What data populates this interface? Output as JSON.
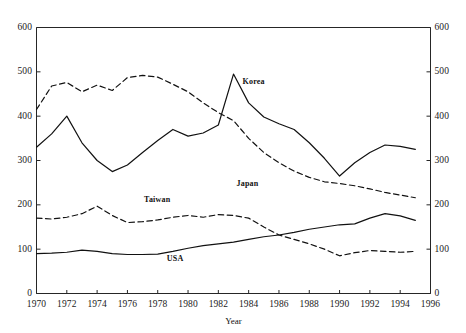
{
  "chart_data": {
    "type": "line",
    "title": "",
    "xlabel": "Year",
    "ylabel": "",
    "xlim": [
      1970,
      1996
    ],
    "ylim": [
      0,
      600
    ],
    "grid": false,
    "legend_position": "inline-annotations",
    "x_ticks": [
      "1970",
      "1972",
      "1974",
      "1976",
      "1978",
      "1980",
      "1982",
      "1984",
      "1986",
      "1988",
      "1990",
      "1992",
      "1994",
      "1996"
    ],
    "y_ticks_left": [
      "0",
      "100",
      "200",
      "300",
      "400",
      "500",
      "600"
    ],
    "y_ticks_right": [
      "0",
      "100",
      "200",
      "300",
      "400",
      "500",
      "600"
    ],
    "x": [
      1970,
      1971,
      1972,
      1973,
      1974,
      1975,
      1976,
      1977,
      1978,
      1979,
      1980,
      1981,
      1982,
      1983,
      1984,
      1985,
      1986,
      1987,
      1988,
      1989,
      1990,
      1991,
      1992,
      1993,
      1994,
      1995
    ],
    "series": [
      {
        "name": "Japan",
        "style": "dashed",
        "color": "#111111",
        "label_x": 1983.2,
        "label_y": 248,
        "values": [
          415,
          468,
          476,
          455,
          470,
          458,
          487,
          492,
          488,
          472,
          455,
          430,
          408,
          390,
          350,
          318,
          295,
          276,
          262,
          252,
          248,
          243,
          236,
          228,
          222,
          216
        ]
      },
      {
        "name": "Korea",
        "style": "solid",
        "color": "#111111",
        "label_x": 1983.6,
        "label_y": 478,
        "values": [
          330,
          360,
          400,
          340,
          300,
          275,
          290,
          318,
          345,
          370,
          355,
          362,
          380,
          495,
          430,
          398,
          383,
          370,
          340,
          305,
          265,
          295,
          318,
          335,
          332,
          325
        ]
      },
      {
        "name": "Taiwan",
        "style": "dashed",
        "color": "#111111",
        "label_x": 1977.1,
        "label_y": 212,
        "values": [
          170,
          168,
          172,
          180,
          197,
          176,
          160,
          162,
          166,
          172,
          176,
          172,
          178,
          176,
          170,
          150,
          132,
          122,
          112,
          100,
          85,
          92,
          97,
          95,
          93,
          95
        ]
      },
      {
        "name": "USA",
        "style": "solid",
        "color": "#111111",
        "label_x": 1978.6,
        "label_y": 78,
        "values": [
          90,
          91,
          93,
          98,
          95,
          90,
          88,
          88,
          89,
          95,
          102,
          108,
          112,
          116,
          122,
          128,
          132,
          138,
          145,
          150,
          155,
          157,
          170,
          180,
          175,
          165
        ]
      }
    ],
    "annotations": [
      {
        "text": "Korea",
        "x": 1983.6,
        "y": 478
      },
      {
        "text": "Japan",
        "x": 1983.2,
        "y": 248
      },
      {
        "text": "Taiwan",
        "x": 1977.1,
        "y": 212
      },
      {
        "text": "USA",
        "x": 1978.6,
        "y": 78
      }
    ]
  },
  "axis": {
    "x_title": "Year"
  }
}
